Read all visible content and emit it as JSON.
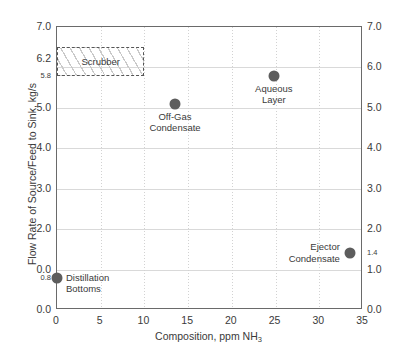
{
  "chart_data": {
    "type": "scatter",
    "title": "",
    "xlabel": "Composition, ppm NH3",
    "xlabel_prefix": "Composition, ppm NH",
    "xlabel_sub": "3",
    "ylabel": "Flow Rate of Source/Feed to Sink, kg/s",
    "xlim": [
      0,
      35
    ],
    "ylim": [
      0,
      7
    ],
    "grid": true,
    "legend": "none",
    "x_ticks": [
      0,
      5,
      10,
      15,
      20,
      25,
      30,
      35
    ],
    "x_tick_labels": [
      "0",
      "5",
      "10",
      "15",
      "20",
      "25",
      "30",
      "35"
    ],
    "left_axis_ticks": [
      {
        "value": 7.0,
        "label": "7.0",
        "minor": false
      },
      {
        "value": 6.2,
        "label": "6.2",
        "minor": false
      },
      {
        "value": 5.8,
        "label": "5.8",
        "minor": true
      },
      {
        "value": 5.0,
        "label": "5.0",
        "minor": false
      },
      {
        "value": 4.0,
        "label": "4.0",
        "minor": false
      },
      {
        "value": 3.0,
        "label": "3.0",
        "minor": false
      },
      {
        "value": 2.0,
        "label": "2.0",
        "minor": false
      },
      {
        "value": 1.0,
        "label": "0.0",
        "minor": false
      },
      {
        "value": 0.8,
        "label": "0.8",
        "minor": true
      },
      {
        "value": 0.0,
        "label": "0.0",
        "minor": false
      }
    ],
    "right_axis_ticks": [
      {
        "value": 7.0,
        "label": "7.0",
        "minor": false
      },
      {
        "value": 6.0,
        "label": "6.0",
        "minor": false
      },
      {
        "value": 5.0,
        "label": "5.0",
        "minor": false
      },
      {
        "value": 4.0,
        "label": "4.0",
        "minor": false
      },
      {
        "value": 3.0,
        "label": "3.0",
        "minor": false
      },
      {
        "value": 2.0,
        "label": "2.0",
        "minor": false
      },
      {
        "value": 1.4,
        "label": "1.4",
        "minor": true
      },
      {
        "value": 1.0,
        "label": "1.0",
        "minor": false
      },
      {
        "value": 0.0,
        "label": "0.0",
        "minor": false
      }
    ],
    "gridlines_y": [
      1.0,
      2.0,
      3.0,
      4.0,
      5.0,
      6.0
    ],
    "gridlines_x": [
      5,
      10,
      15,
      20,
      25,
      30
    ],
    "marker_color": "#5d5d5d",
    "points": [
      {
        "name": "Off-Gas Condensate",
        "label": "Off-Gas\nCondensate",
        "x": 13.5,
        "y": 5.1,
        "label_pos": "below"
      },
      {
        "name": "Aqueous Layer",
        "label": "Aqueous\nLayer",
        "x": 24.8,
        "y": 5.8,
        "label_pos": "below"
      },
      {
        "name": "Ejector Condensate",
        "label": "Ejector\nCondensate",
        "x": 33.5,
        "y": 1.4,
        "label_pos": "left"
      },
      {
        "name": "Distillation Bottoms",
        "label": "Distillation\nBottoms",
        "x": 0.0,
        "y": 0.8,
        "label_pos": "right"
      }
    ],
    "regions": [
      {
        "name": "Scrubber",
        "label": "Scrubber",
        "x0": 0,
        "x1": 10,
        "y0": 5.8,
        "y1": 6.5,
        "style": "dashed-hatched"
      }
    ]
  }
}
